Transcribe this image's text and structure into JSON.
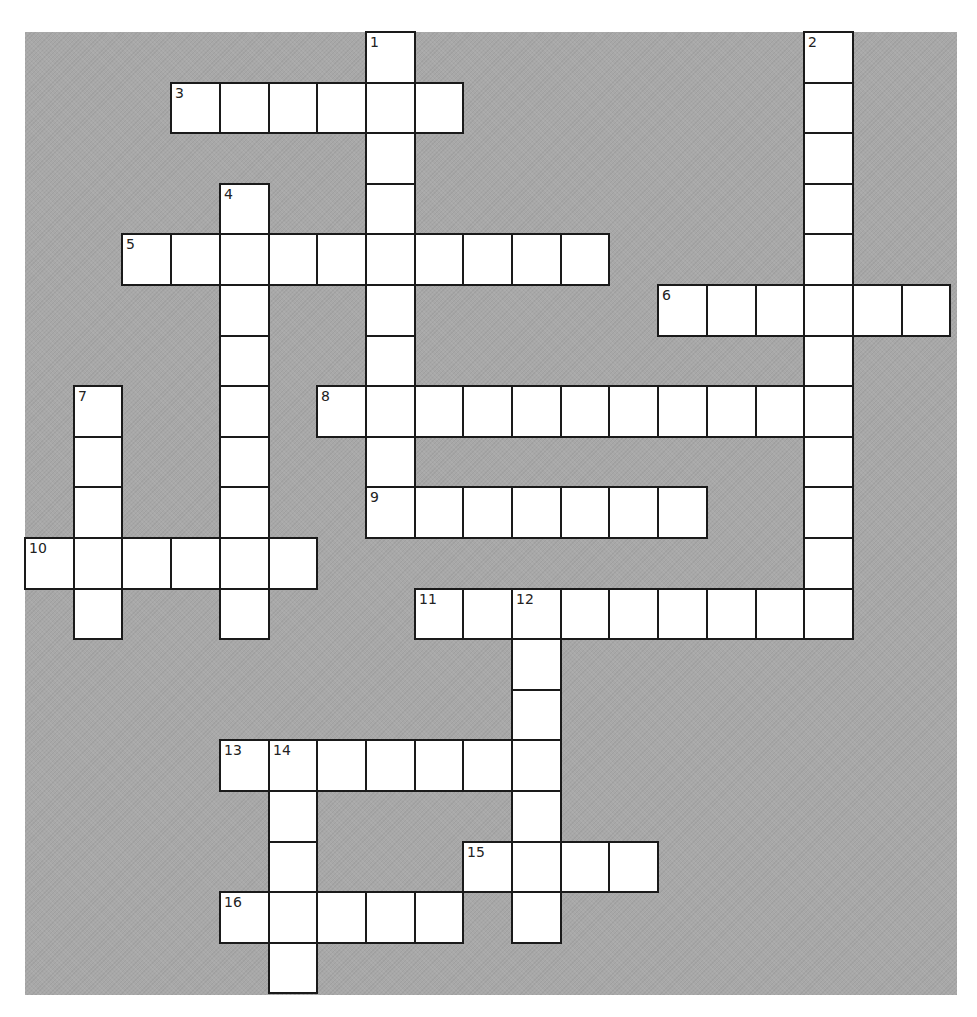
{
  "puzzle": {
    "type": "crossword",
    "grid": {
      "cols": 19,
      "rows": 19,
      "cell_width": 48.7,
      "cell_height": 50.6,
      "background_color": "#a8a8a8",
      "cell_color": "#ffffff",
      "border_color": "#1a1a1a"
    },
    "entries": [
      {
        "number": "1",
        "direction": "down",
        "row": 0,
        "col": 7,
        "length": 10
      },
      {
        "number": "2",
        "direction": "down",
        "row": 0,
        "col": 16,
        "length": 12
      },
      {
        "number": "3",
        "direction": "across",
        "row": 1,
        "col": 3,
        "length": 6
      },
      {
        "number": "4",
        "direction": "down",
        "row": 3,
        "col": 4,
        "length": 9
      },
      {
        "number": "5",
        "direction": "across",
        "row": 4,
        "col": 2,
        "length": 10
      },
      {
        "number": "6",
        "direction": "across",
        "row": 5,
        "col": 13,
        "length": 6
      },
      {
        "number": "7",
        "direction": "down",
        "row": 7,
        "col": 1,
        "length": 5
      },
      {
        "number": "8",
        "direction": "across",
        "row": 7,
        "col": 6,
        "length": 11
      },
      {
        "number": "9",
        "direction": "across",
        "row": 9,
        "col": 7,
        "length": 7
      },
      {
        "number": "10",
        "direction": "across",
        "row": 10,
        "col": 0,
        "length": 6
      },
      {
        "number": "11",
        "direction": "across",
        "row": 11,
        "col": 8,
        "length": 9
      },
      {
        "number": "12",
        "direction": "down",
        "row": 11,
        "col": 10,
        "length": 7
      },
      {
        "number": "13",
        "direction": "across",
        "row": 14,
        "col": 4,
        "length": 7
      },
      {
        "number": "14",
        "direction": "down",
        "row": 14,
        "col": 5,
        "length": 5
      },
      {
        "number": "15",
        "direction": "across",
        "row": 16,
        "col": 9,
        "length": 4
      },
      {
        "number": "16",
        "direction": "across",
        "row": 17,
        "col": 4,
        "length": 5
      }
    ]
  }
}
